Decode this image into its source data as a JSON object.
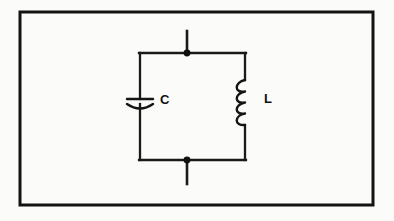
{
  "figure": {
    "background_color": "#fbfbf9",
    "ink_color": "#141414",
    "frame": {
      "name": "outer-border",
      "x": 20,
      "y": 12,
      "width": 353,
      "height": 193,
      "stroke_width": 3
    },
    "circuit": {
      "type": "parallel-lc-tank",
      "loop": {
        "left_x": 140,
        "right_x": 245,
        "top_y": 53,
        "bottom_y": 160,
        "stroke_width": 2
      },
      "terminals": [
        {
          "name": "top-terminal-lead",
          "x": 187,
          "y_start": 31,
          "y_end": 53,
          "node_y": 53
        },
        {
          "name": "bottom-terminal-lead",
          "x": 187,
          "y_start": 160,
          "y_end": 184,
          "node_y": 160
        }
      ],
      "nodes": [
        {
          "name": "top-junction-dot",
          "x": 187,
          "y": 53,
          "r": 3.4
        },
        {
          "name": "bottom-junction-dot",
          "x": 187,
          "y": 160,
          "r": 3.4
        }
      ],
      "components": [
        {
          "name": "capacitor",
          "symbol": "capacitor-curved-plate",
          "label": "C",
          "label_x": 160,
          "label_y": 101,
          "branch": "left",
          "center_x": 140,
          "plate_y": 99,
          "arc_y": 104,
          "plate_half_width": 13
        },
        {
          "name": "inductor",
          "symbol": "inductor-coil",
          "label": "L",
          "label_x": 264,
          "label_y": 100,
          "branch": "right",
          "center_x": 245,
          "coil_top_y": 79,
          "coil_bottom_y": 126,
          "loops": 4,
          "bulge_direction": "left"
        }
      ]
    }
  }
}
